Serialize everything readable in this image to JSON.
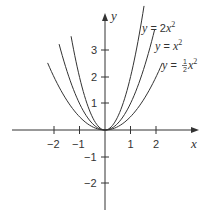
{
  "chart_data": {
    "type": "line",
    "title": "",
    "xlabel": "x",
    "ylabel": "y",
    "xlim": [
      -2.6,
      3.6
    ],
    "ylim": [
      -3,
      4.3
    ],
    "grid": false,
    "legend_position": "inline labels at upper right of curves",
    "x_ticks": [
      -2,
      -1,
      1,
      2
    ],
    "y_ticks": [
      -2,
      -1,
      1,
      2,
      3
    ],
    "x_tick_labels": [
      "−2",
      "−1",
      "1",
      "2"
    ],
    "y_tick_labels": [
      "−2",
      "−1",
      "1",
      "2",
      "3"
    ],
    "series": [
      {
        "name": "y = 2x²",
        "coefficient": 2,
        "x_range": [
          -1.33,
          1.53
        ],
        "formula": "y = 2*x^2"
      },
      {
        "name": "y = x²",
        "coefficient": 1,
        "x_range": [
          -1.8,
          1.95
        ],
        "formula": "y = x^2"
      },
      {
        "name": "y = ½x²",
        "coefficient": 0.5,
        "x_range": [
          -2.25,
          2.25
        ],
        "formula": "y = 0.5*x^2"
      }
    ],
    "annotations": [
      {
        "text": "y = 2x²",
        "near": "top of steepest parabola"
      },
      {
        "text": "y = x²",
        "near": "top of middle parabola"
      },
      {
        "text": "y = ½x²",
        "near": "top of widest parabola"
      }
    ]
  },
  "labels": {
    "x_axis": "x",
    "y_axis": "y",
    "curve1": {
      "y": "y",
      "eq": " = 2",
      "x": "x",
      "sup": "2"
    },
    "curve2": {
      "y": "y",
      "eq": " = ",
      "x": "x",
      "sup": "2"
    },
    "curve3": {
      "y": "y",
      "eq": " = ",
      "num": "1",
      "den": "2",
      "x": "x",
      "sup": "2"
    },
    "xticks": [
      "−2",
      "−1",
      "1",
      "2"
    ],
    "yticks": [
      "3",
      "2",
      "1",
      "−1",
      "−2"
    ]
  },
  "colors": {
    "axis": "#333333",
    "curve": "#333333",
    "background": "#ffffff"
  }
}
